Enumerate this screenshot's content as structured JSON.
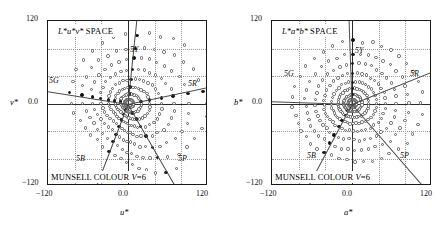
{
  "figure": {
    "panels": [
      {
        "id": "luv",
        "title_symbol": "L*u*v*",
        "title_space": "SPACE",
        "caption": "MUNSELL COLOUR ",
        "caption_value": "V",
        "caption_eq": "=6",
        "xlabel": "u*",
        "ylabel": "v*",
        "ticks_x": [
          "−120",
          "0.0",
          "120"
        ],
        "ticks_y": [
          "120",
          "0.0",
          "−120"
        ],
        "hue_labels": [
          {
            "text": "5Y",
            "x": 82,
            "y": 24
          },
          {
            "text": "5R",
            "x": 140,
            "y": 58
          },
          {
            "text": "5G",
            "x": 1,
            "y": 55
          },
          {
            "text": "5B",
            "x": 28,
            "y": 133
          },
          {
            "text": "5P",
            "x": 130,
            "y": 133
          }
        ]
      },
      {
        "id": "lab",
        "title_symbol": "L*a*b*",
        "title_space": "SPACE",
        "caption": "MUNSELL COLOUR ",
        "caption_value": "V",
        "caption_eq": "=6",
        "xlabel": "a*",
        "ylabel": "b*",
        "ticks_x": [
          "−120",
          "0.0",
          "120"
        ],
        "ticks_y": [
          "120",
          "0.0",
          "−120"
        ],
        "hue_labels": [
          {
            "text": "5Y",
            "x": 83,
            "y": 25
          },
          {
            "text": "5R",
            "x": 138,
            "y": 48
          },
          {
            "text": "5G",
            "x": 12,
            "y": 48
          },
          {
            "text": "5B",
            "x": 35,
            "y": 130
          },
          {
            "text": "5P",
            "x": 128,
            "y": 130
          }
        ]
      }
    ]
  },
  "chart_data": {
    "type": "scatter",
    "panels": [
      {
        "name": "L*u*v* SPACE",
        "xlabel": "u*",
        "ylabel": "v*",
        "xlim": [
          -120,
          120
        ],
        "ylim": [
          -120,
          120
        ],
        "xticks": [
          -120,
          0,
          120
        ],
        "yticks": [
          -120,
          0,
          120
        ],
        "grid": true,
        "grid_step": 40,
        "annotations": [
          "5Y",
          "5R",
          "5G",
          "5B",
          "5P",
          "MUNSELL COLOUR V=6"
        ],
        "hue_lines": [
          {
            "label": "5R",
            "angle_deg": 12
          },
          {
            "label": "5Y",
            "angle_deg": 84
          },
          {
            "label": "5G",
            "angle_deg": 171
          },
          {
            "label": "5B",
            "angle_deg": 249
          },
          {
            "label": "5P",
            "angle_deg": 300
          }
        ],
        "series": [
          {
            "name": "principal hue samples",
            "marker": "filled-circle"
          },
          {
            "name": "intermediate hue samples",
            "marker": "open-circle"
          }
        ],
        "chroma_rings": [
          6,
          14,
          24,
          36,
          50,
          66,
          84,
          104
        ],
        "hue_count": 40,
        "description": "Radial constant-hue loci spread asymmetrically; chroma contours elongated toward 5R and 5P"
      },
      {
        "name": "L*a*b* SPACE",
        "xlabel": "a*",
        "ylabel": "b*",
        "xlim": [
          -120,
          120
        ],
        "ylim": [
          -120,
          120
        ],
        "xticks": [
          -120,
          0,
          120
        ],
        "yticks": [
          -120,
          0,
          120
        ],
        "grid": true,
        "grid_step": 40,
        "annotations": [
          "5Y",
          "5R",
          "5G",
          "5B",
          "5P",
          "MUNSELL COLOUR V=6"
        ],
        "hue_lines": [
          {
            "label": "5R",
            "angle_deg": 22
          },
          {
            "label": "5Y",
            "angle_deg": 92
          },
          {
            "label": "5G",
            "angle_deg": 178
          },
          {
            "label": "5B",
            "angle_deg": 242
          },
          {
            "label": "5P",
            "angle_deg": 311
          }
        ],
        "series": [
          {
            "name": "principal hue samples",
            "marker": "filled-circle"
          },
          {
            "name": "intermediate hue samples",
            "marker": "open-circle"
          }
        ],
        "chroma_rings": [
          6,
          13,
          22,
          32,
          44,
          58,
          74,
          92
        ],
        "hue_count": 40,
        "description": "Radial constant-hue loci more evenly distributed; chroma contours closer to circular"
      }
    ]
  }
}
